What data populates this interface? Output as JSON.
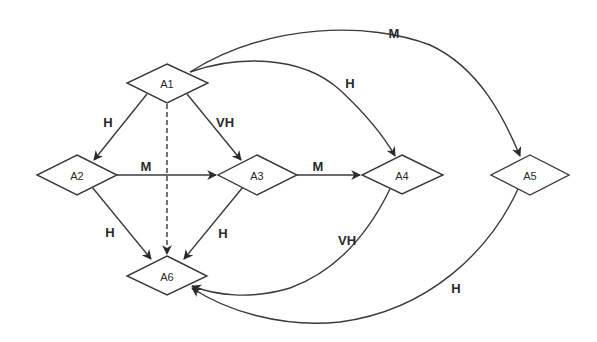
{
  "diagram": {
    "type": "directed-graph",
    "nodes": [
      {
        "id": "A1",
        "label": "A1",
        "cx": 167,
        "cy": 83
      },
      {
        "id": "A2",
        "label": "A2",
        "cx": 77,
        "cy": 175
      },
      {
        "id": "A3",
        "label": "A3",
        "cx": 257,
        "cy": 175
      },
      {
        "id": "A4",
        "label": "A4",
        "cx": 402,
        "cy": 175
      },
      {
        "id": "A5",
        "label": "A5",
        "cx": 530,
        "cy": 175
      },
      {
        "id": "A6",
        "label": "A6",
        "cx": 167,
        "cy": 276
      }
    ],
    "edges": [
      {
        "from": "A1",
        "to": "A2",
        "label": "H",
        "style": "solid"
      },
      {
        "from": "A1",
        "to": "A3",
        "label": "VH",
        "style": "solid"
      },
      {
        "from": "A1",
        "to": "A6",
        "label": "",
        "style": "dashed"
      },
      {
        "from": "A1",
        "to": "A4",
        "label": "H",
        "style": "solid-curved"
      },
      {
        "from": "A1",
        "to": "A5",
        "label": "M",
        "style": "solid-curved"
      },
      {
        "from": "A2",
        "to": "A3",
        "label": "M",
        "style": "solid"
      },
      {
        "from": "A2",
        "to": "A6",
        "label": "H",
        "style": "solid"
      },
      {
        "from": "A3",
        "to": "A4",
        "label": "M",
        "style": "solid"
      },
      {
        "from": "A3",
        "to": "A6",
        "label": "H",
        "style": "solid"
      },
      {
        "from": "A4",
        "to": "A6",
        "label": "VH",
        "style": "solid-curved"
      },
      {
        "from": "A5",
        "to": "A6",
        "label": "H",
        "style": "solid-curved"
      }
    ]
  }
}
